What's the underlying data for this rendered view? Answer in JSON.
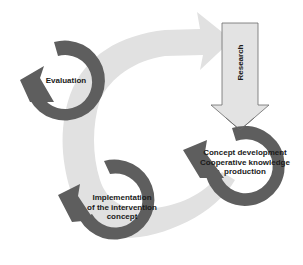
{
  "diagram": {
    "type": "cycle",
    "colors": {
      "cycle_arrow": "#e1e1e1",
      "ring": "#5e5e5e",
      "research_arrow_fill": "#e3e3e3",
      "research_arrow_stroke": "#6a6a6a",
      "text": "#1a1a1a",
      "background": "#ffffff"
    },
    "nodes": [
      {
        "id": "evaluation",
        "lines": [
          "Evaluation"
        ]
      },
      {
        "id": "implementation",
        "lines": [
          "Implementation",
          "of the intervention",
          "concept"
        ]
      },
      {
        "id": "concept",
        "lines": [
          "Concept development",
          "Cooperative knowledge",
          "production"
        ]
      }
    ],
    "research_arrow": {
      "label": "Research",
      "direction": "down"
    },
    "cycle_arrow": {
      "direction": "clockwise",
      "points_to": "research"
    }
  }
}
